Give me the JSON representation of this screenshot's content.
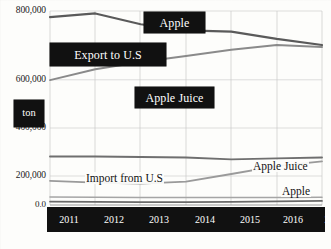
{
  "chart_data": {
    "type": "line",
    "title": "",
    "subtitle": "",
    "xlabel": "",
    "ylabel": "ton",
    "unit_label": "ton",
    "grid": true,
    "legend_position": "inline-callouts",
    "ylim": [
      0,
      800000
    ],
    "xlim_categories": [
      "2011",
      "2012",
      "2013",
      "2014",
      "2015",
      "2016",
      "2017*"
    ],
    "categories": [
      "2011",
      "2012",
      "2013",
      "2014",
      "2015",
      "2016",
      "2017*"
    ],
    "ytick_labels": [
      "800,000",
      "600,000",
      "400,000",
      "200,000",
      "0.0"
    ],
    "ytick_values": [
      800000,
      600000,
      400000,
      200000,
      0
    ],
    "groups": [
      {
        "name": "Export to U.S",
        "callout": "Export to U.S"
      },
      {
        "name": "Import from U.S",
        "callout": "Import from U.S"
      }
    ],
    "series": [
      {
        "name": "Apple",
        "group": "Export to U.S",
        "label": "Apple",
        "label_style": "callout-box",
        "color": "#5a5a5a",
        "values": [
          775000,
          790000,
          745000,
          720000,
          715000,
          685000,
          660000
        ]
      },
      {
        "name": "Apple Juice",
        "group": "Export to U.S",
        "label": "Apple Juice",
        "label_style": "callout-box",
        "color": "#8a8a8a",
        "values": [
          515000,
          560000,
          590000,
          615000,
          640000,
          660000,
          652000
        ]
      },
      {
        "name": "Apple Juice",
        "group": "Import from U.S",
        "label": "Apple Juice",
        "label_style": "plain-right",
        "color": "#6f6f6f",
        "values": [
          200000,
          200000,
          198000,
          196000,
          188000,
          192000,
          196000
        ]
      },
      {
        "name": "Apple",
        "group": "Import from U.S",
        "label": "Apple",
        "label_style": "plain-right",
        "color": "#9a9a9a",
        "values": [
          100000,
          92000,
          88000,
          96000,
          128000,
          160000,
          180000
        ]
      },
      {
        "name": "Other A",
        "group": "Import from U.S",
        "label": "",
        "label_style": "none",
        "color": "#a5a5a5",
        "values": [
          33000,
          32000,
          31000,
          31000,
          31000,
          31000,
          32000
        ]
      },
      {
        "name": "Other B",
        "group": "Import from U.S",
        "label": "",
        "label_style": "none",
        "color": "#6a6a6a",
        "values": [
          14000,
          13000,
          12000,
          12000,
          13000,
          15000,
          17000
        ]
      }
    ],
    "annotations": [
      {
        "text": "Apple",
        "kind": "callout-box"
      },
      {
        "text": "Export to U.S",
        "kind": "callout-box"
      },
      {
        "text": "Apple Juice",
        "kind": "callout-box"
      },
      {
        "text": "ton",
        "kind": "callout-box"
      },
      {
        "text": "Import from U.S",
        "kind": "plain"
      },
      {
        "text": "Apple Juice",
        "kind": "plain"
      },
      {
        "text": "Apple",
        "kind": "plain"
      }
    ]
  },
  "callouts": {
    "apple_export": "Apple",
    "export_to_us": "Export to U.S",
    "apple_juice_export": "Apple Juice",
    "unit": "ton"
  },
  "plain_labels": {
    "import_from_us": "Import from U.S",
    "apple_juice_import": "Apple Juice",
    "apple_import": "Apple"
  },
  "axis": {
    "y_labels": [
      "800,000",
      "600,000",
      "400,000",
      "200,000",
      "0.0"
    ],
    "x_labels": [
      "2011",
      "2012",
      "2013",
      "2014",
      "2015",
      "2016",
      "2017*"
    ]
  }
}
